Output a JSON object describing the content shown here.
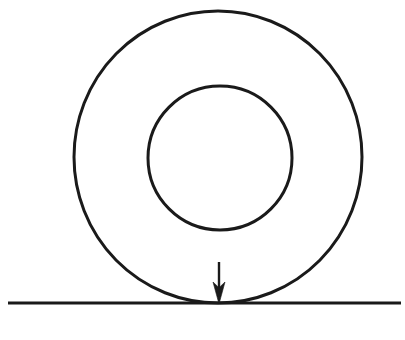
{
  "figure": {
    "title": "Ring resting on a horizontal line with downward arrow at contact point",
    "caption": "",
    "background_color": "#ffffff",
    "stroke_color": "#1a1a1a",
    "canvas": {
      "width": 405,
      "height": 340
    }
  },
  "chart_data": {
    "type": "diagram",
    "title": "Ring resting on a horizontal line with downward arrow at contact point",
    "xlabel": "",
    "ylabel": "",
    "grid": false,
    "legend": false,
    "xlim": [
      0,
      405
    ],
    "ylim": [
      0,
      340
    ],
    "shapes": [
      {
        "name": "outer-circle",
        "type": "circle",
        "cx": 218,
        "cy": 157,
        "r": 145,
        "rx": 144,
        "ry": 146,
        "fill": "none",
        "stroke": "#1a1a1a",
        "stroke_width": 3
      },
      {
        "name": "inner-circle",
        "type": "circle",
        "cx": 220,
        "cy": 158,
        "r": 72,
        "rx": 72,
        "ry": 72,
        "fill": "none",
        "stroke": "#1a1a1a",
        "stroke_width": 3
      },
      {
        "name": "ground-line",
        "type": "line",
        "x1": 8,
        "y1": 303,
        "x2": 401,
        "y2": 303,
        "stroke": "#1a1a1a",
        "stroke_width": 3
      },
      {
        "name": "force-arrow",
        "type": "arrow",
        "x1": 219,
        "y1": 262,
        "x2": 219,
        "y2": 304,
        "shaft_width": 2,
        "head_width": 12,
        "head_length": 22,
        "stroke": "#1a1a1a",
        "fill": "#1a1a1a",
        "direction": "down"
      }
    ],
    "annotations": [
      {
        "name": "tangent-point",
        "x": 218,
        "y": 303,
        "label": ""
      }
    ]
  }
}
